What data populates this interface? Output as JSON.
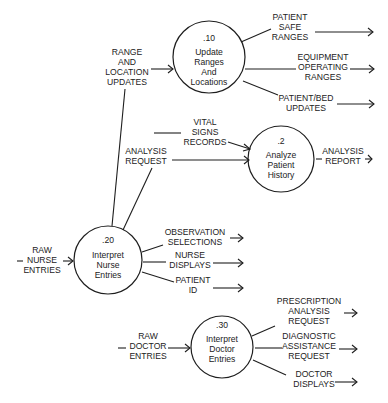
{
  "diagram": {
    "type": "data-flow-diagram",
    "processes": [
      {
        "id": "p10",
        "number": ".10",
        "lines": [
          "Update",
          "Ranges",
          "And",
          "Locations"
        ]
      },
      {
        "id": "p2",
        "number": ".2",
        "lines": [
          "Analyze",
          "Patient",
          "History"
        ]
      },
      {
        "id": "p20",
        "number": ".20",
        "lines": [
          "Interpret",
          "Nurse",
          "Entries"
        ]
      },
      {
        "id": "p30",
        "number": ".30",
        "lines": [
          "Interpret",
          "Doctor",
          "Entries"
        ]
      }
    ],
    "flows": {
      "range_location_updates": [
        "RANGE",
        "AND",
        "LOCATION",
        "UPDATES"
      ],
      "patient_safe_ranges": [
        "PATIENT",
        "SAFE",
        "RANGES"
      ],
      "equipment_operating_ranges": [
        "EQUIPMENT",
        "OPERATING",
        "RANGES"
      ],
      "patient_bed_updates": [
        "PATIENT/BED",
        "UPDATES"
      ],
      "vital_signs_records": [
        "VITAL",
        "SIGNS",
        "RECORDS"
      ],
      "analysis_request": [
        "ANALYSIS",
        "REQUEST"
      ],
      "analysis_report": [
        "ANALYSIS",
        "REPORT"
      ],
      "raw_nurse_entries": [
        "RAW",
        "NURSE",
        "ENTRIES"
      ],
      "observation_selections": [
        "OBSERVATION",
        "SELECTIONS"
      ],
      "nurse_displays": [
        "NURSE",
        "DISPLAYS"
      ],
      "patient_id": [
        "PATIENT",
        "ID"
      ],
      "raw_doctor_entries": [
        "RAW",
        "DOCTOR",
        "ENTRIES"
      ],
      "prescription_analysis_request": [
        "PRESCRIPTION",
        "ANALYSIS",
        "REQUEST"
      ],
      "diagnostic_assistance_request": [
        "DIAGNOSTIC",
        "ASSISTANCE",
        "REQUEST"
      ],
      "doctor_displays": [
        "DOCTOR",
        "DISPLAYS"
      ]
    },
    "colors": {
      "line": "#1e1e1e",
      "text": "#222222",
      "background": "#ffffff"
    }
  }
}
